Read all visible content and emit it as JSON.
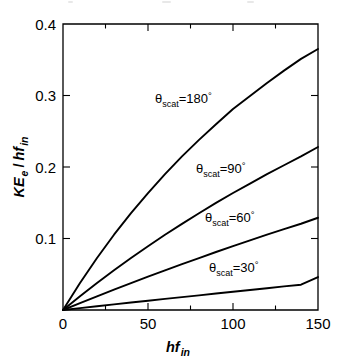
{
  "figure": {
    "kind": "compton-scattering-plot",
    "background": "#ffffff",
    "ink": "#000000"
  },
  "axes": {
    "x": {
      "label_main": "hf",
      "label_sub": "in",
      "min": 0,
      "max": 150,
      "major_ticks": [
        0,
        50,
        100,
        150
      ],
      "minor_ticks": [
        25,
        75,
        125
      ],
      "tick_labels": [
        "0",
        "50",
        "100",
        "150"
      ]
    },
    "y": {
      "label_num_main": "KE",
      "label_num_sub": "e",
      "label_slash": "/",
      "label_den_main": "hf",
      "label_den_sub": "in",
      "min": 0,
      "max": 0.4,
      "major_ticks": [
        0.1,
        0.2,
        0.3,
        0.4
      ],
      "tick_labels": [
        "0.1",
        "0.2",
        "0.3",
        "0.4"
      ]
    }
  },
  "annotations": [
    {
      "name": "label-180",
      "theta_symbol": "θ",
      "subscript": "scat",
      "equals": "=",
      "value": "180",
      "degree": "°",
      "x": 155,
      "y": 103
    },
    {
      "name": "label-90",
      "theta_symbol": "θ",
      "subscript": "scat",
      "equals": "=",
      "value": "90",
      "degree": "°",
      "x": 196,
      "y": 173
    },
    {
      "name": "label-60",
      "theta_symbol": "θ",
      "subscript": "scat",
      "equals": "=",
      "value": "60",
      "degree": "°",
      "x": 205,
      "y": 222
    },
    {
      "name": "label-30",
      "theta_symbol": "θ",
      "subscript": "scat",
      "equals": "=",
      "value": "30",
      "degree": "°",
      "x": 209,
      "y": 272
    }
  ],
  "chart_data": {
    "type": "line",
    "title": "",
    "subtitle": "",
    "xlabel": "hf_in",
    "ylabel": "KE_e / hf_in",
    "xlim": [
      0,
      150
    ],
    "ylim": [
      0,
      0.4
    ],
    "grid": false,
    "legend": "inline-annotations",
    "x": [
      0,
      10,
      20,
      30,
      40,
      50,
      60,
      70,
      80,
      90,
      100,
      110,
      120,
      130,
      140,
      150
    ],
    "series": [
      {
        "name": "θscat=180°",
        "values": [
          0,
          0.0377,
          0.0727,
          0.1053,
          0.1354,
          0.1636,
          0.1901,
          0.2148,
          0.2379,
          0.2597,
          0.2812,
          0.2992,
          0.3176,
          0.3348,
          0.3512,
          0.365
        ]
      },
      {
        "name": "θscat=90°",
        "values": [
          0,
          0.0192,
          0.0377,
          0.0555,
          0.0727,
          0.0892,
          0.1053,
          0.1205,
          0.1354,
          0.1498,
          0.1636,
          0.1768,
          0.1901,
          0.2024,
          0.2148,
          0.228
        ]
      },
      {
        "name": "θscat=60°",
        "values": [
          0,
          0.0097,
          0.0192,
          0.0285,
          0.0377,
          0.0467,
          0.0555,
          0.0642,
          0.0727,
          0.0811,
          0.0892,
          0.0973,
          0.1053,
          0.113,
          0.1206,
          0.129
        ]
      },
      {
        "name": "θscat=30°",
        "values": [
          0,
          0.0026,
          0.0052,
          0.0078,
          0.0104,
          0.0129,
          0.0155,
          0.018,
          0.0205,
          0.023,
          0.0255,
          0.028,
          0.0305,
          0.033,
          0.0354,
          0.046
        ]
      }
    ]
  }
}
